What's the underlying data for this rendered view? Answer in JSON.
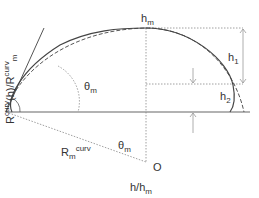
{
  "diagram": {
    "type": "geometry-schematic",
    "labels": {
      "h_max": {
        "base": "h",
        "sub": "m"
      },
      "h1": {
        "base": "h",
        "sub": "1"
      },
      "h2": {
        "base": "h",
        "sub": "2"
      },
      "theta_upper": {
        "base": "θ",
        "sub": "m"
      },
      "theta_lower": {
        "base": "θ",
        "sub": "m"
      },
      "radius": {
        "base": "R",
        "sub": "m",
        "sup": "curv"
      },
      "origin": "O",
      "x_axis": {
        "base": "h/h",
        "sub": "m"
      },
      "y_axis": {
        "p1": "R",
        "p1_sup": "curv",
        "p2": "(h)/R",
        "p2_sup": "curv",
        "p2_sub": "m"
      }
    },
    "elements": [
      "solid baseline",
      "solid circular-cap profile",
      "dashed fitted profile",
      "tangent line at contact point",
      "dotted radius lines to center O",
      "dotted horizontal guides at h_m and h2",
      "vertical arrow h1",
      "vertical arrows h2"
    ],
    "colors": {
      "line": "#555555",
      "text": "#333333",
      "background": "#ffffff"
    }
  }
}
